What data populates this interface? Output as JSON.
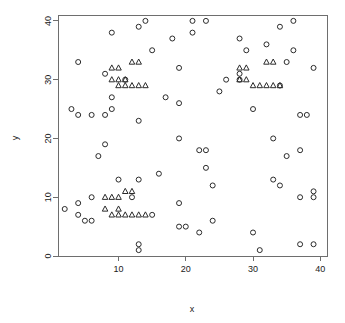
{
  "chart_data": {
    "type": "scatter",
    "title": "",
    "subtitle": "",
    "xlabel": "x",
    "ylabel": "y",
    "xlim": [
      1,
      41
    ],
    "ylim": [
      0,
      41
    ],
    "xticks": [
      10,
      20,
      30,
      40
    ],
    "yticks": [
      0,
      10,
      20,
      30,
      40
    ],
    "grid": false,
    "legend": null,
    "legend_position": "none",
    "box": true,
    "point_color": "#2b2b2b",
    "axis_color": "#6e6e6e",
    "background": "#ffffff",
    "series": [
      {
        "name": "circles",
        "marker": "circle",
        "points": [
          [
            4,
            33
          ],
          [
            3,
            25
          ],
          [
            4,
            24
          ],
          [
            6,
            24
          ],
          [
            8,
            24
          ],
          [
            9,
            25
          ],
          [
            8,
            31
          ],
          [
            9,
            38
          ],
          [
            9,
            27
          ],
          [
            7,
            17
          ],
          [
            8,
            19
          ],
          [
            2,
            8
          ],
          [
            4,
            9
          ],
          [
            4,
            7
          ],
          [
            5,
            6
          ],
          [
            6,
            6
          ],
          [
            6,
            10
          ],
          [
            10,
            13
          ],
          [
            12,
            10
          ],
          [
            13,
            13
          ],
          [
            13,
            23
          ],
          [
            13,
            39
          ],
          [
            14,
            40
          ],
          [
            15,
            35
          ],
          [
            15,
            7
          ],
          [
            13,
            2
          ],
          [
            13,
            1
          ],
          [
            17,
            27
          ],
          [
            18,
            37
          ],
          [
            19,
            32
          ],
          [
            19,
            26
          ],
          [
            19,
            20
          ],
          [
            19,
            9
          ],
          [
            19,
            5
          ],
          [
            20,
            5
          ],
          [
            21,
            40
          ],
          [
            21,
            38
          ],
          [
            22,
            18
          ],
          [
            23,
            18
          ],
          [
            22,
            4
          ],
          [
            23,
            15
          ],
          [
            23,
            40
          ],
          [
            24,
            12
          ],
          [
            24,
            6
          ],
          [
            25,
            28
          ],
          [
            26,
            30
          ],
          [
            28,
            37
          ],
          [
            28,
            30
          ],
          [
            28,
            31
          ],
          [
            29,
            35
          ],
          [
            30,
            4
          ],
          [
            30,
            25
          ],
          [
            31,
            1
          ],
          [
            32,
            36
          ],
          [
            33,
            20
          ],
          [
            33,
            13
          ],
          [
            34,
            39
          ],
          [
            34,
            12
          ],
          [
            34,
            29
          ],
          [
            35,
            17
          ],
          [
            35,
            33
          ],
          [
            36,
            40
          ],
          [
            36,
            35
          ],
          [
            37,
            18
          ],
          [
            37,
            24
          ],
          [
            37,
            10
          ],
          [
            37,
            2
          ],
          [
            38,
            24
          ],
          [
            39,
            32
          ],
          [
            39,
            10
          ],
          [
            39,
            11
          ],
          [
            39,
            2
          ],
          [
            16,
            14
          ],
          [
            11,
            30
          ]
        ]
      },
      {
        "name": "triangles",
        "marker": "triangle",
        "points": [
          [
            9,
            32
          ],
          [
            10,
            32
          ],
          [
            12,
            33
          ],
          [
            13,
            33
          ],
          [
            9,
            30
          ],
          [
            10,
            30
          ],
          [
            10,
            29
          ],
          [
            11,
            29
          ],
          [
            11,
            30
          ],
          [
            12,
            29
          ],
          [
            13,
            29
          ],
          [
            14,
            29
          ],
          [
            28,
            32
          ],
          [
            29,
            32
          ],
          [
            32,
            33
          ],
          [
            33,
            33
          ],
          [
            28,
            30
          ],
          [
            29,
            30
          ],
          [
            30,
            29
          ],
          [
            31,
            29
          ],
          [
            32,
            29
          ],
          [
            33,
            29
          ],
          [
            34,
            29
          ],
          [
            8,
            10
          ],
          [
            9,
            10
          ],
          [
            10,
            10
          ],
          [
            11,
            11
          ],
          [
            12,
            11
          ],
          [
            8,
            8
          ],
          [
            10,
            8
          ],
          [
            9,
            7
          ],
          [
            10,
            7
          ],
          [
            11,
            7
          ],
          [
            12,
            7
          ],
          [
            13,
            7
          ],
          [
            14,
            7
          ]
        ]
      }
    ]
  }
}
